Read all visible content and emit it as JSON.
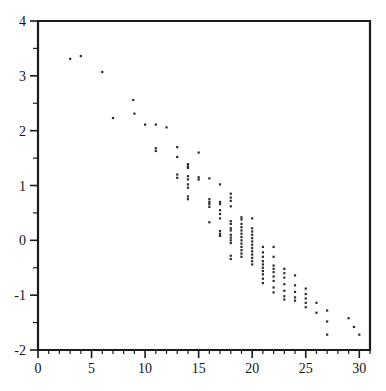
{
  "chart_data": {
    "type": "scatter",
    "title": "",
    "subtitle": "",
    "xlabel": "",
    "ylabel": "",
    "xlim": [
      0,
      31
    ],
    "ylim": [
      -2,
      4
    ],
    "grid": false,
    "legend": null,
    "x_ticks_major": [
      0,
      5,
      10,
      15,
      20,
      25,
      30
    ],
    "x_tick_labels": [
      "0",
      "5",
      "10",
      "15",
      "20",
      "25",
      "30"
    ],
    "x_ticks_minor": [
      1,
      2,
      3,
      4,
      6,
      7,
      8,
      9,
      11,
      12,
      13,
      14,
      16,
      17,
      18,
      19,
      21,
      22,
      23,
      24,
      26,
      27,
      28,
      29,
      31
    ],
    "y_ticks_major": [
      -2,
      -1,
      0,
      1,
      2,
      3,
      4
    ],
    "y_tick_labels": [
      "-2",
      "-1",
      "0",
      "1",
      "2",
      "3",
      "4"
    ],
    "y_ticks_minor": [
      -1.5,
      -0.5,
      0.5,
      1.5,
      2.5,
      3.5
    ],
    "marker": "square-dot",
    "marker_size_px": 2.2,
    "marker_color": "#2a2a2a",
    "series": [
      {
        "name": "observations",
        "points": [
          [
            3.0,
            3.31
          ],
          [
            4.0,
            3.36
          ],
          [
            6.0,
            3.07
          ],
          [
            7.0,
            2.23
          ],
          [
            8.9,
            2.56
          ],
          [
            9.0,
            2.31
          ],
          [
            10.0,
            2.11
          ],
          [
            11.0,
            2.11
          ],
          [
            11.0,
            1.68
          ],
          [
            11.0,
            1.63
          ],
          [
            12.0,
            2.06
          ],
          [
            13.0,
            1.7
          ],
          [
            13.0,
            1.52
          ],
          [
            13.0,
            1.2
          ],
          [
            13.0,
            1.14
          ],
          [
            14.0,
            1.39
          ],
          [
            14.0,
            1.35
          ],
          [
            14.0,
            1.32
          ],
          [
            14.0,
            1.17
          ],
          [
            14.0,
            1.11
          ],
          [
            14.0,
            1.02
          ],
          [
            14.0,
            0.96
          ],
          [
            14.0,
            0.8
          ],
          [
            14.0,
            0.75
          ],
          [
            15.0,
            1.6
          ],
          [
            15.0,
            1.15
          ],
          [
            15.0,
            1.11
          ],
          [
            16.0,
            1.13
          ],
          [
            16.0,
            0.75
          ],
          [
            16.0,
            0.7
          ],
          [
            16.0,
            0.66
          ],
          [
            16.0,
            0.61
          ],
          [
            16.0,
            0.33
          ],
          [
            17.0,
            1.02
          ],
          [
            17.0,
            0.7
          ],
          [
            17.0,
            0.66
          ],
          [
            17.0,
            0.55
          ],
          [
            17.0,
            0.48
          ],
          [
            17.0,
            0.4
          ],
          [
            17.0,
            0.17
          ],
          [
            17.0,
            0.12
          ],
          [
            17.0,
            0.08
          ],
          [
            18.0,
            0.85
          ],
          [
            18.0,
            0.78
          ],
          [
            18.0,
            0.72
          ],
          [
            18.0,
            0.62
          ],
          [
            18.0,
            0.35
          ],
          [
            18.0,
            0.3
          ],
          [
            18.0,
            0.22
          ],
          [
            18.0,
            0.18
          ],
          [
            18.0,
            0.1
          ],
          [
            18.0,
            0.05
          ],
          [
            18.0,
            0.0
          ],
          [
            18.0,
            -0.05
          ],
          [
            18.0,
            -0.28
          ],
          [
            18.0,
            -0.34
          ],
          [
            19.0,
            0.42
          ],
          [
            19.0,
            0.38
          ],
          [
            19.0,
            0.3
          ],
          [
            19.0,
            0.24
          ],
          [
            19.0,
            0.18
          ],
          [
            19.0,
            0.12
          ],
          [
            19.0,
            0.06
          ],
          [
            19.0,
            0.0
          ],
          [
            19.0,
            -0.06
          ],
          [
            19.0,
            -0.12
          ],
          [
            19.0,
            -0.18
          ],
          [
            19.0,
            -0.24
          ],
          [
            19.0,
            -0.3
          ],
          [
            20.0,
            0.4
          ],
          [
            20.0,
            0.22
          ],
          [
            20.0,
            0.16
          ],
          [
            20.0,
            0.1
          ],
          [
            20.0,
            0.04
          ],
          [
            20.0,
            -0.02
          ],
          [
            20.0,
            -0.08
          ],
          [
            20.0,
            -0.14
          ],
          [
            20.0,
            -0.2
          ],
          [
            20.0,
            -0.26
          ],
          [
            20.0,
            -0.32
          ],
          [
            20.0,
            -0.38
          ],
          [
            20.0,
            -0.44
          ],
          [
            21.0,
            -0.12
          ],
          [
            21.0,
            -0.22
          ],
          [
            21.0,
            -0.3
          ],
          [
            21.0,
            -0.38
          ],
          [
            21.0,
            -0.44
          ],
          [
            21.0,
            -0.5
          ],
          [
            21.0,
            -0.56
          ],
          [
            21.0,
            -0.62
          ],
          [
            21.0,
            -0.7
          ],
          [
            21.0,
            -0.78
          ],
          [
            22.0,
            -0.12
          ],
          [
            22.0,
            -0.3
          ],
          [
            22.0,
            -0.46
          ],
          [
            22.0,
            -0.52
          ],
          [
            22.0,
            -0.58
          ],
          [
            22.0,
            -0.66
          ],
          [
            22.0,
            -0.74
          ],
          [
            22.0,
            -0.86
          ],
          [
            22.0,
            -0.95
          ],
          [
            23.0,
            -0.52
          ],
          [
            23.0,
            -0.6
          ],
          [
            23.0,
            -0.68
          ],
          [
            23.0,
            -0.8
          ],
          [
            23.0,
            -0.92
          ],
          [
            23.0,
            -1.02
          ],
          [
            23.0,
            -1.08
          ],
          [
            24.0,
            -0.64
          ],
          [
            24.0,
            -0.82
          ],
          [
            24.0,
            -0.94
          ],
          [
            24.0,
            -1.04
          ],
          [
            24.0,
            -1.1
          ],
          [
            25.0,
            -0.88
          ],
          [
            25.0,
            -0.98
          ],
          [
            25.0,
            -1.06
          ],
          [
            25.0,
            -1.14
          ],
          [
            25.0,
            -1.22
          ],
          [
            26.0,
            -1.14
          ],
          [
            26.0,
            -1.32
          ],
          [
            27.0,
            -1.28
          ],
          [
            27.0,
            -1.48
          ],
          [
            27.0,
            -1.72
          ],
          [
            29.0,
            -1.42
          ],
          [
            29.5,
            -1.58
          ],
          [
            30.0,
            -1.72
          ]
        ]
      }
    ]
  }
}
